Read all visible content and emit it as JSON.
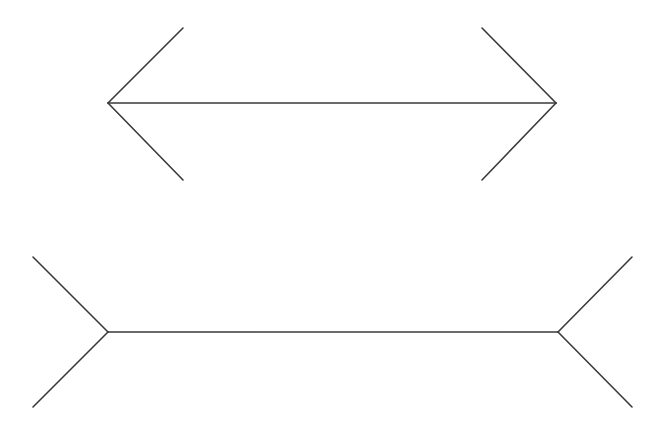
{
  "diagram": {
    "type": "muller-lyer-illusion",
    "background": "#ffffff",
    "stroke_color": "#3a3a3a",
    "stroke_width": 1.6,
    "figures": [
      {
        "name": "arrowheads-outward",
        "shaft": {
          "x1": 108,
          "y1": 103,
          "x2": 556,
          "y2": 103
        },
        "fins": [
          {
            "x1": 108,
            "y1": 103,
            "x2": 183,
            "y2": 28
          },
          {
            "x1": 108,
            "y1": 103,
            "x2": 183,
            "y2": 180
          },
          {
            "x1": 556,
            "y1": 103,
            "x2": 482,
            "y2": 28
          },
          {
            "x1": 556,
            "y1": 103,
            "x2": 482,
            "y2": 180
          }
        ]
      },
      {
        "name": "arrowheads-inward",
        "shaft": {
          "x1": 108,
          "y1": 332,
          "x2": 558,
          "y2": 332
        },
        "fins": [
          {
            "x1": 108,
            "y1": 332,
            "x2": 33,
            "y2": 257
          },
          {
            "x1": 108,
            "y1": 332,
            "x2": 33,
            "y2": 407
          },
          {
            "x1": 558,
            "y1": 332,
            "x2": 632,
            "y2": 257
          },
          {
            "x1": 558,
            "y1": 332,
            "x2": 632,
            "y2": 407
          }
        ]
      }
    ]
  }
}
